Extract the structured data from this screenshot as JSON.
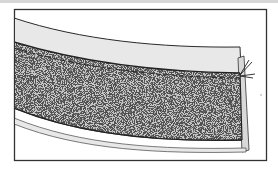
{
  "figure": {
    "colors": {
      "frame": "#333333",
      "band_light": "#e6e6e6",
      "speckle_base": "#cfcfcf",
      "speckle_dark": "#444444",
      "background": "#ffffff"
    }
  }
}
